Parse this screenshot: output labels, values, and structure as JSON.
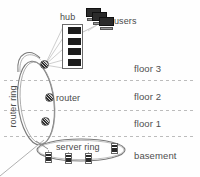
{
  "diagram": {
    "background_color": "#fefefe",
    "line_color": "#6b6b6b",
    "dashed_color": "#b9b9b9"
  },
  "labels": {
    "hub": "hub",
    "users": "users",
    "router": "router",
    "router_ring": "router ring",
    "server_ring": "server ring"
  },
  "floors": [
    {
      "id": "floor3",
      "label": "floor 3"
    },
    {
      "id": "floor2",
      "label": "floor 2"
    },
    {
      "id": "floor1",
      "label": "floor 1"
    },
    {
      "id": "basement",
      "label": "basement"
    }
  ],
  "nodes": {
    "routers": [
      {
        "id": "router-3",
        "floor": "floor 3"
      },
      {
        "id": "router-2",
        "floor": "floor 2"
      },
      {
        "id": "router-1",
        "floor": "floor 1"
      }
    ],
    "servers": [
      {
        "id": "server-1"
      },
      {
        "id": "server-2"
      },
      {
        "id": "server-3"
      },
      {
        "id": "server-4"
      }
    ],
    "hub": {
      "units": 4
    },
    "users": {
      "workstations": 3
    }
  }
}
